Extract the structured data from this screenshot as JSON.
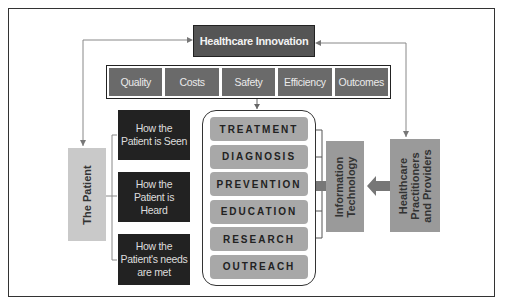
{
  "diagram": {
    "top": {
      "label": "Healthcare Innovation"
    },
    "factors": [
      {
        "label": "Quality"
      },
      {
        "label": "Costs"
      },
      {
        "label": "Safety"
      },
      {
        "label": "Efficiency"
      },
      {
        "label": "Outcomes"
      }
    ],
    "patient": {
      "label": "The Patient"
    },
    "patient_aspects": [
      {
        "label": "How the Patient is Seen"
      },
      {
        "label": "How the Patient is Heard"
      },
      {
        "label": "How the Patient's needs are met"
      }
    ],
    "care_areas": [
      {
        "label": "TREATMENT"
      },
      {
        "label": "DIAGNOSIS"
      },
      {
        "label": "PREVENTION"
      },
      {
        "label": "EDUCATION"
      },
      {
        "label": "RESEARCH"
      },
      {
        "label": "OUTREACH"
      }
    ],
    "information_technology": {
      "line1": "Information",
      "line2": "Technology"
    },
    "providers": {
      "line1": "Healthcare",
      "line2": "Practitioners",
      "line3": "and Providers"
    },
    "colors": {
      "dark_box": "#222222",
      "medium_box": "#6a6a6a",
      "light_box": "#a8a8a8",
      "patient_box": "#c9c9c9",
      "arrow": "#777777"
    }
  }
}
